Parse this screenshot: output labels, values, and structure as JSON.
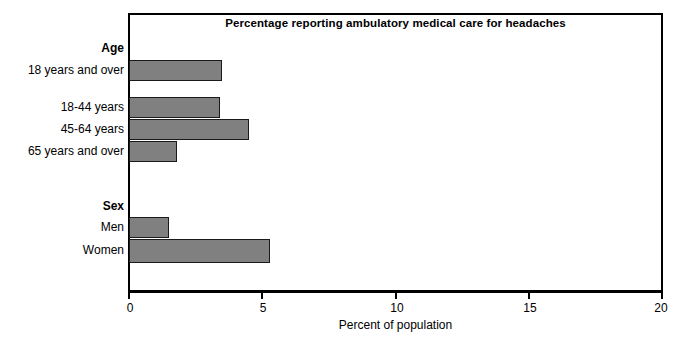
{
  "chart_data": {
    "type": "bar",
    "orientation": "horizontal",
    "title": "Percentage reporting ambulatory medical care for headaches",
    "xlabel": "Percent of population",
    "ylabel": "",
    "xlim": [
      0,
      20
    ],
    "xticks": [
      0,
      5,
      10,
      15,
      20
    ],
    "xticklabels": [
      "0",
      "5",
      "10",
      "15",
      "20"
    ],
    "grid": false,
    "legend": null,
    "bar_color": "#808080",
    "bar_edge_color": "#1a1a1a",
    "frame_color": "#000000",
    "groups": [
      {
        "name": "Age",
        "categories": [
          "18 years and over",
          "18-44 years",
          "45-64 years",
          "65 years and over"
        ],
        "values": [
          3.5,
          3.4,
          4.5,
          1.8
        ]
      },
      {
        "name": "Sex",
        "categories": [
          "Men",
          "Women"
        ],
        "values": [
          1.5,
          5.3
        ]
      }
    ],
    "categories": [
      "18 years and over",
      "18-44 years",
      "45-64 years",
      "65 years and over",
      "Men",
      "Women"
    ],
    "values": [
      3.5,
      3.4,
      4.5,
      1.8,
      1.5,
      5.3
    ]
  },
  "labels": {
    "group_age": "Age",
    "group_sex": "Sex",
    "age_18_over": "18 years and over",
    "age_18_44": "18-44 years",
    "age_45_64": "45-64 years",
    "age_65_over": "65 years and over",
    "sex_men": "Men",
    "sex_women": "Women"
  },
  "ticks": {
    "t0": "0",
    "t5": "5",
    "t10": "10",
    "t15": "15",
    "t20": "20"
  }
}
